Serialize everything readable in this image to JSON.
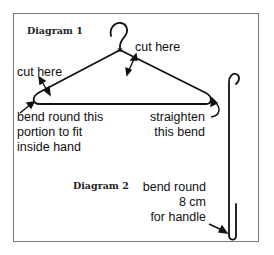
{
  "diagram1": {
    "title": "Diagram 1",
    "labels": {
      "cut_here_top": "cut here",
      "cut_here_left": "cut here",
      "bend_line1": "bend round this",
      "bend_line2": "portion to fit",
      "bend_line3": "inside hand",
      "straighten_line1": "straighten",
      "straighten_line2": "this bend"
    }
  },
  "diagram2": {
    "title": "Diagram 2",
    "labels": {
      "line1": "bend round",
      "line2": "8 cm",
      "line3": "for handle"
    }
  },
  "colors": {
    "ink": "#111111",
    "frame": "#7a7a7a",
    "background": "#ffffff"
  }
}
